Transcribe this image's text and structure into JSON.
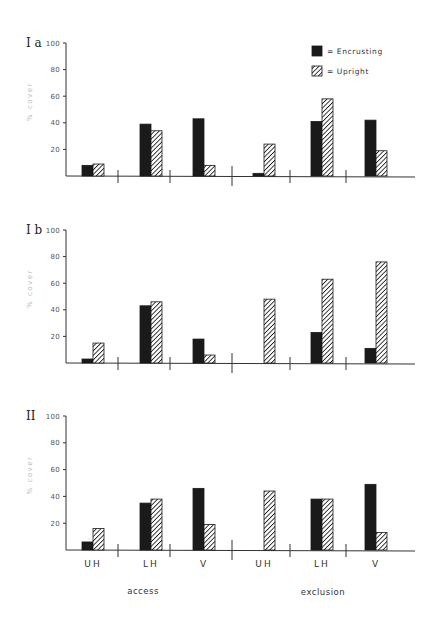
{
  "chart_data": [
    {
      "type": "bar",
      "panel": "Ia",
      "title": "I a",
      "ylabel": "% cover",
      "ylim": [
        0,
        100
      ],
      "yticks": [
        20,
        40,
        60,
        80,
        100
      ],
      "groups": [
        "access",
        "exclusion"
      ],
      "categories": [
        "UH",
        "LH",
        "V",
        "UH",
        "LH",
        "V"
      ],
      "series": [
        {
          "name": "Encrusting",
          "pattern": "solid",
          "values": [
            8,
            39,
            43,
            2,
            41,
            42
          ]
        },
        {
          "name": "Upright",
          "pattern": "hatched",
          "values": [
            9,
            34,
            8,
            24,
            58,
            19
          ]
        }
      ]
    },
    {
      "type": "bar",
      "panel": "Ib",
      "title": "I b",
      "ylabel": "% cover",
      "ylim": [
        0,
        100
      ],
      "yticks": [
        20,
        40,
        60,
        80,
        100
      ],
      "groups": [
        "access",
        "exclusion"
      ],
      "categories": [
        "UH",
        "LH",
        "V",
        "UH",
        "LH",
        "V"
      ],
      "series": [
        {
          "name": "Encrusting",
          "pattern": "solid",
          "values": [
            3,
            43,
            18,
            0,
            23,
            11
          ]
        },
        {
          "name": "Upright",
          "pattern": "hatched",
          "values": [
            15,
            46,
            6,
            48,
            63,
            76
          ]
        }
      ]
    },
    {
      "type": "bar",
      "panel": "II",
      "title": "II",
      "ylabel": "% cover",
      "ylim": [
        0,
        100
      ],
      "yticks": [
        20,
        40,
        60,
        80,
        100
      ],
      "groups": [
        "access",
        "exclusion"
      ],
      "categories": [
        "UH",
        "LH",
        "V",
        "UH",
        "LH",
        "V"
      ],
      "series": [
        {
          "name": "Encrusting",
          "pattern": "solid",
          "values": [
            6,
            35,
            46,
            0,
            38,
            49
          ]
        },
        {
          "name": "Upright",
          "pattern": "hatched",
          "values": [
            16,
            38,
            19,
            44,
            38,
            13
          ]
        }
      ]
    }
  ],
  "legend": {
    "position": "top-right of panel Ia",
    "items": [
      {
        "label": "= Encrusting",
        "pattern": "solid"
      },
      {
        "label": "= Upright",
        "pattern": "hatched"
      }
    ]
  },
  "x_axis": {
    "category_labels": [
      "UH",
      "LH",
      "V",
      "UH",
      "LH",
      "V"
    ],
    "group_labels": [
      "access",
      "exclusion"
    ]
  },
  "colors": {
    "bar_fill": "#1a1a1a",
    "axis": "#333333",
    "background": "#ffffff"
  }
}
